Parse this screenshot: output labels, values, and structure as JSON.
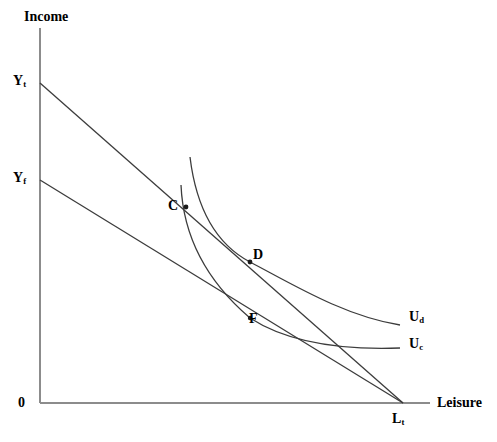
{
  "figure": {
    "kind": "labor-leisure-indifference-curve-diagram",
    "background_color": "#ffffff",
    "line_color": "#3c3c3c",
    "axis_color": "#8c8c8c",
    "text_color": "#000000",
    "width": 497,
    "height": 442
  },
  "axes": {
    "y_title": "Income",
    "x_title": "Leisure",
    "origin_label": "0",
    "origin_px": {
      "x": 40,
      "y": 403
    },
    "y_axis_top_px": {
      "x": 40,
      "y": 28
    },
    "x_axis_right_px": {
      "x": 430,
      "y": 403
    }
  },
  "y_ticks": [
    {
      "id": "Y_t",
      "base": "Y",
      "sub": "t",
      "px": {
        "x": 40,
        "y": 83
      }
    },
    {
      "id": "Y_f",
      "base": "Y",
      "sub": "f",
      "px": {
        "x": 40,
        "y": 180
      }
    }
  ],
  "x_ticks": [
    {
      "id": "L_t",
      "base": "L",
      "sub": "t",
      "px": {
        "x": 403,
        "y": 403
      }
    }
  ],
  "budget_lines": [
    {
      "name": "upper-budget-line",
      "from_label": "Y_t",
      "to_label": "L_t",
      "from_px": {
        "x": 40,
        "y": 83
      },
      "to_px": {
        "x": 403,
        "y": 403
      }
    },
    {
      "name": "lower-budget-line",
      "from_label": "Y_f",
      "to_label": "L_t",
      "from_px": {
        "x": 40,
        "y": 180
      },
      "to_px": {
        "x": 403,
        "y": 403
      }
    }
  ],
  "indifference_curves": [
    {
      "name": "U_d",
      "base": "U",
      "sub": "d",
      "label_px": {
        "x": 409,
        "y": 310
      },
      "path": "M 190 157 C 196 206, 214 243, 250 262 C 292 284, 344 316, 400 325"
    },
    {
      "name": "U_c",
      "base": "U",
      "sub": "c",
      "label_px": {
        "x": 409,
        "y": 337
      },
      "path": "M 181 185 C 183 232, 202 277, 250 318 C 290 344, 345 350, 400 348"
    }
  ],
  "points": [
    {
      "label": "C",
      "px": {
        "x": 186,
        "y": 207
      },
      "label_px": {
        "x": 168,
        "y": 199
      },
      "description": "intersection on lower budget line and U_c"
    },
    {
      "label": "D",
      "px": {
        "x": 250,
        "y": 262
      },
      "label_px": {
        "x": 253,
        "y": 248
      },
      "description": "tangency of upper budget line and U_d"
    },
    {
      "label": "F",
      "px": {
        "x": 250,
        "y": 318
      },
      "label_px": {
        "x": 249,
        "y": 312
      },
      "description": "tangency of lower budget line and U_c"
    }
  ]
}
